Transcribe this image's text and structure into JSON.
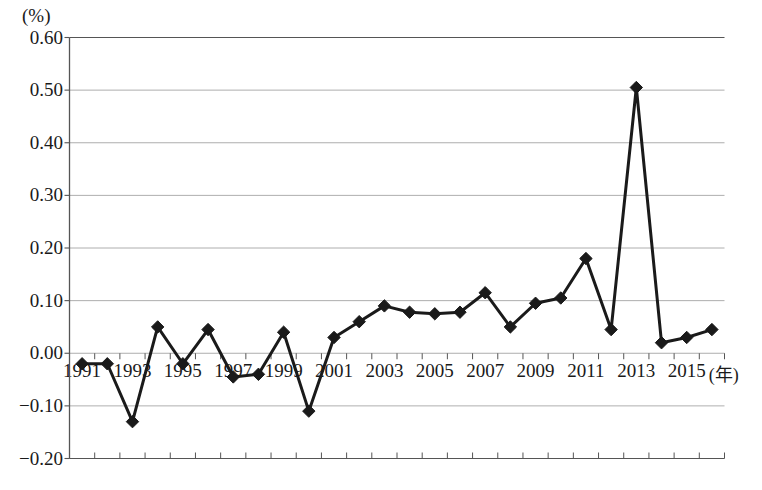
{
  "chart_data": {
    "type": "line",
    "title": "",
    "subtitle": "",
    "xlabel": "(年)",
    "ylabel": "(%)",
    "ylim": [
      -0.2,
      0.6
    ],
    "xlim": [
      1991,
      2016
    ],
    "grid": true,
    "legend": "none",
    "marker": "filled-diamond",
    "y_ticks": [
      "0.60",
      "0.50",
      "0.40",
      "0.30",
      "0.20",
      "0.10",
      "0.00",
      "-0.10",
      "-0.20"
    ],
    "y_tick_values": [
      0.6,
      0.5,
      0.4,
      0.3,
      0.2,
      0.1,
      0.0,
      -0.1,
      -0.2
    ],
    "x_ticks": [
      "1991",
      "1993",
      "1995",
      "1997",
      "1999",
      "2001",
      "2003",
      "2005",
      "2007",
      "2009",
      "2011",
      "2013",
      "2015"
    ],
    "x_tick_values": [
      1991,
      1993,
      1995,
      1997,
      1999,
      2001,
      2003,
      2005,
      2007,
      2009,
      2011,
      2013,
      2015
    ],
    "x": [
      1991,
      1992,
      1993,
      1994,
      1995,
      1996,
      1997,
      1998,
      1999,
      2000,
      2001,
      2002,
      2003,
      2004,
      2005,
      2006,
      2007,
      2008,
      2009,
      2010,
      2011,
      2012,
      2013,
      2014,
      2015,
      2016
    ],
    "values": [
      -0.02,
      -0.02,
      -0.13,
      0.05,
      -0.02,
      0.045,
      -0.045,
      -0.04,
      0.04,
      -0.11,
      0.03,
      0.06,
      0.09,
      0.078,
      0.075,
      0.078,
      0.115,
      0.05,
      0.095,
      0.105,
      0.18,
      0.045,
      0.505,
      0.02,
      0.03,
      0.045
    ],
    "series": [
      {
        "name": "",
        "values": [
          -0.02,
          -0.02,
          -0.13,
          0.05,
          -0.02,
          0.045,
          -0.045,
          -0.04,
          0.04,
          -0.11,
          0.03,
          0.06,
          0.09,
          0.078,
          0.075,
          0.078,
          0.115,
          0.05,
          0.095,
          0.105,
          0.18,
          0.045,
          0.505,
          0.02,
          0.03,
          0.045
        ]
      }
    ],
    "colors": {
      "line": "#1a1a1a",
      "marker": "#1a1a1a",
      "grid": "#999999",
      "axis": "#555555",
      "background": "#ffffff"
    }
  }
}
